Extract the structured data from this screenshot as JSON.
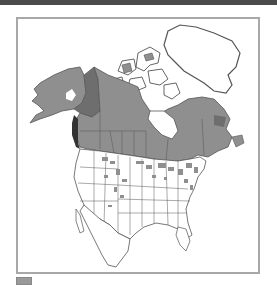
{
  "map": {
    "title": "",
    "region": "North America",
    "colors": {
      "range_fill": "#8f8f8f",
      "range_dark": "#6e6e6e",
      "land_fill": "#ffffff",
      "outline": "#555555",
      "frame_border": "#a8a8a8",
      "top_band": "#4a4a4a"
    }
  },
  "legend": {
    "items": [
      {
        "swatch_color": "#9a9a9a",
        "label": ""
      }
    ]
  }
}
